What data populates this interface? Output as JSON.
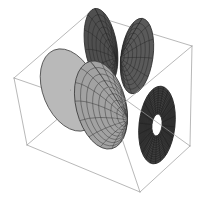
{
  "figure": {
    "background_color": "#ffffff",
    "width": 207,
    "height": 207
  },
  "bounding_box": {
    "name": "wireframe-cuboid",
    "stroke_color": "#9a9a9a",
    "stroke_width": 0.7,
    "vertices": {
      "back_top_left": [
        14,
        78
      ],
      "back_top_right": [
        88,
        14
      ],
      "front_top_right": [
        192,
        46
      ],
      "front_top_left": [
        113,
        112
      ],
      "back_bottom_left": [
        27,
        145
      ],
      "back_bottom_right": [
        101,
        82
      ],
      "front_bottom_right": [
        190,
        146
      ],
      "front_bottom_left": [
        140,
        192
      ]
    }
  },
  "surfaces": [
    {
      "id": "lobe-left",
      "label": "Left light lobe",
      "fill_color": "#b9b9b9",
      "mesh_color": "#4a4a4a",
      "center": [
        70,
        90
      ],
      "radius_x": 27,
      "radius_y": 43,
      "rotation_deg": -22,
      "apex": [
        100,
        116
      ],
      "shading": "light",
      "mesh_meridians": 12,
      "mesh_parallels": 7
    },
    {
      "id": "lobe-upper-left-dark",
      "label": "Upper left dark lobe",
      "fill_color": "#4f4f4f",
      "mesh_color": "#2a2a2a",
      "center": [
        101,
        47
      ],
      "radius_x": 16,
      "radius_y": 39,
      "rotation_deg": -9,
      "apex": [
        116,
        58
      ],
      "shading": "dark",
      "mesh_meridians": 12,
      "mesh_parallels": 7
    },
    {
      "id": "lobe-upper-right-dark",
      "label": "Upper right dark lobe",
      "fill_color": "#5a5a5a",
      "mesh_color": "#2a2a2a",
      "center": [
        137,
        56
      ],
      "radius_x": 16,
      "radius_y": 38,
      "rotation_deg": 8,
      "apex": [
        120,
        58
      ],
      "shading": "dark",
      "mesh_meridians": 12,
      "mesh_parallels": 7
    },
    {
      "id": "lobe-center",
      "label": "Center medium lobe",
      "fill_color": "#a2a2a2",
      "mesh_color": "#3c3c3c",
      "center": [
        101,
        105
      ],
      "radius_x": 25,
      "radius_y": 45,
      "rotation_deg": -14,
      "apex": [
        129,
        120
      ],
      "shading": "medium",
      "mesh_meridians": 14,
      "mesh_parallels": 8
    },
    {
      "id": "ring-right",
      "label": "Right dark ring torus",
      "fill_color": "#3e3e3e",
      "mesh_color": "#1c1c1c",
      "center": [
        157,
        125
      ],
      "radius_x": 18,
      "radius_y": 39,
      "rotation_deg": 6,
      "hole_radius_x": 5,
      "hole_radius_y": 11,
      "shading": "very-dark",
      "mesh_meridians": 22,
      "mesh_parallels": 11
    }
  ],
  "palette": {
    "box_line": "#9a9a9a",
    "light_surface": "#b9b9b9",
    "medium_surface": "#a2a2a2",
    "dark_surface": "#4f4f4f",
    "very_dark_surface": "#3e3e3e",
    "mesh_light": "#4a4a4a",
    "mesh_dark": "#1f1f1f",
    "background": "#ffffff"
  }
}
